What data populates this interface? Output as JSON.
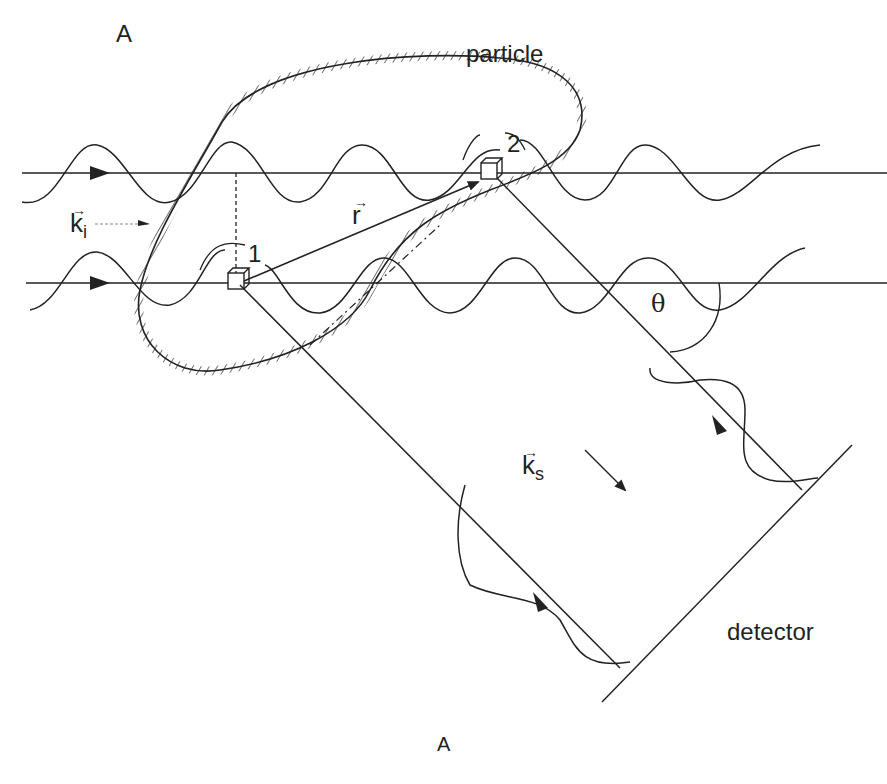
{
  "figure": {
    "panel_label_top": "A",
    "panel_label_bottom": "A",
    "particle_label": "particle",
    "detector_label": "detector",
    "incident_wavevector": {
      "symbol": "k",
      "subscript": "i"
    },
    "scattered_wavevector": {
      "symbol": "k",
      "subscript": "s"
    },
    "position_vector": {
      "symbol": "r"
    },
    "scattering_angle": "θ",
    "scatterer_1": "1",
    "scatterer_2": "2"
  },
  "colors": {
    "line": "#222222",
    "background": "#ffffff"
  }
}
